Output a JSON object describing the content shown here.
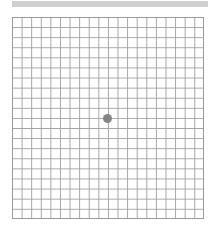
{
  "chart": {
    "title": "Amsler grid",
    "rows": 20,
    "columns": 20,
    "grid_line_color": "#a4a4a4",
    "border_color": "#9a9a9a",
    "dot_color": "#858585",
    "top_bar_color": "#d0d0d0",
    "background_color": "#ffffff"
  }
}
